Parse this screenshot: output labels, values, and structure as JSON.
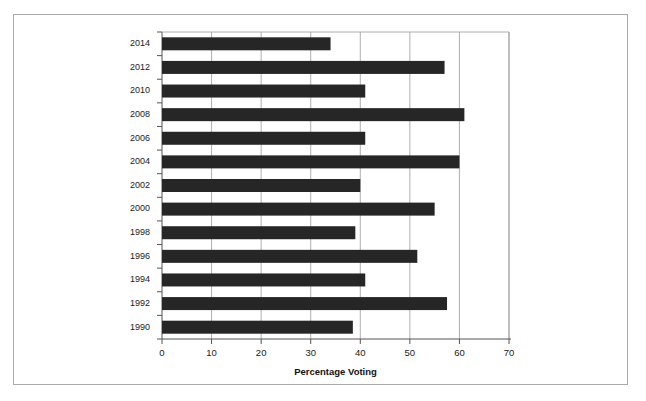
{
  "chart_data": {
    "type": "bar",
    "orientation": "horizontal",
    "title": "",
    "xlabel": "Percentage Voting",
    "ylabel": "",
    "xlim": [
      0,
      70
    ],
    "ylim": null,
    "grid": "vertical",
    "legend": "none",
    "xticks": [
      0,
      10,
      20,
      30,
      40,
      50,
      60,
      70
    ],
    "xtick_labels": [
      "0",
      "10",
      "20",
      "30",
      "40",
      "50",
      "60",
      "70"
    ],
    "categories": [
      "2014",
      "2012",
      "2010",
      "2008",
      "2006",
      "2004",
      "2002",
      "2000",
      "1998",
      "1996",
      "1994",
      "1992",
      "1990"
    ],
    "values": [
      34,
      57,
      41,
      61,
      41,
      60,
      40,
      55,
      39,
      51.5,
      41,
      57.5,
      38.5
    ],
    "series": [
      {
        "name": "Percentage Voting",
        "values": [
          34,
          57,
          41,
          61,
          41,
          60,
          40,
          55,
          39,
          51.5,
          41,
          57.5,
          38.5
        ],
        "color": "#262626"
      }
    ]
  },
  "colors": {
    "bar": "#262626",
    "grid": "#9a9a9a",
    "axis": "#555555",
    "frame": "#aaaaaa",
    "text": "#1a1a1a",
    "background": "#ffffff"
  },
  "figure": {
    "axis_title": "Percentage Voting"
  }
}
